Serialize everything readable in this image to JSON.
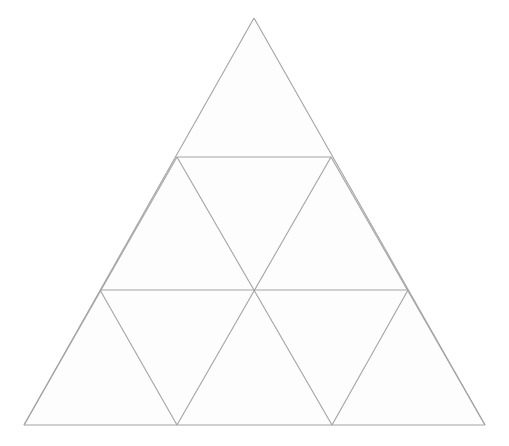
{
  "canvas": {
    "width": 509,
    "height": 446,
    "background_color": "#ffffff"
  },
  "figure": {
    "name": "subdivided-equilateral-triangle",
    "title": "",
    "rows": 3,
    "small_triangle_count": 9,
    "upward_triangle_count": 6,
    "downward_triangle_count": 3,
    "stroke_color": "#a3a3a3",
    "stroke_width": 1.1,
    "fill_color": "#fdfdfd",
    "outer_vertices": {
      "apex": [
        254,
        18
      ],
      "bottom_left": [
        24,
        425
      ],
      "bottom_right": [
        485,
        425
      ]
    },
    "row_baselines_y": [
      18,
      157,
      290,
      425
    ],
    "lattice_points": [
      {
        "id": "A",
        "label": "apex",
        "x": 254,
        "y": 18
      },
      {
        "id": "B1",
        "label": "row1-left",
        "x": 177,
        "y": 157
      },
      {
        "id": "B2",
        "label": "row1-right",
        "x": 331,
        "y": 157
      },
      {
        "id": "C1",
        "label": "row2-left",
        "x": 100,
        "y": 290
      },
      {
        "id": "C2",
        "label": "row2-center",
        "x": 254,
        "y": 290
      },
      {
        "id": "C3",
        "label": "row2-right",
        "x": 408,
        "y": 290
      },
      {
        "id": "D1",
        "label": "base-left",
        "x": 24,
        "y": 425
      },
      {
        "id": "D2",
        "label": "base-mid-left",
        "x": 177,
        "y": 425
      },
      {
        "id": "D3",
        "label": "base-mid-right",
        "x": 332,
        "y": 425
      },
      {
        "id": "D4",
        "label": "base-right",
        "x": 485,
        "y": 425
      }
    ],
    "faces": [
      {
        "id": "t1",
        "orientation": "up",
        "row": 1,
        "points": "254,18 177,157 331,157"
      },
      {
        "id": "t2",
        "orientation": "up",
        "row": 2,
        "points": "177,157 100,290 254,290"
      },
      {
        "id": "t3",
        "orientation": "down",
        "row": 2,
        "points": "331,157 177,157 254,290"
      },
      {
        "id": "t4",
        "orientation": "up",
        "row": 2,
        "points": "331,157 254,290 408,290"
      },
      {
        "id": "t5",
        "orientation": "up",
        "row": 3,
        "points": "100,290 24,425 177,425"
      },
      {
        "id": "t6",
        "orientation": "down",
        "row": 3,
        "points": "254,290 100,290 177,425"
      },
      {
        "id": "t7",
        "orientation": "up",
        "row": 3,
        "points": "254,290 177,425 332,425"
      },
      {
        "id": "t8",
        "orientation": "down",
        "row": 3,
        "points": "408,290 254,290 332,425"
      },
      {
        "id": "t9",
        "orientation": "up",
        "row": 3,
        "points": "408,290 332,425 485,425"
      }
    ],
    "edges": [
      {
        "id": "e-outer-left",
        "label": "outer-left-side",
        "x1": 254,
        "y1": 18,
        "x2": 24,
        "y2": 425
      },
      {
        "id": "e-outer-right",
        "label": "outer-right-side",
        "x1": 254,
        "y1": 18,
        "x2": 485,
        "y2": 425
      },
      {
        "id": "e-outer-base",
        "label": "outer-base",
        "x1": 24,
        "y1": 425,
        "x2": 485,
        "y2": 425
      },
      {
        "id": "e-h1",
        "label": "horizontal-upper",
        "x1": 177,
        "y1": 157,
        "x2": 331,
        "y2": 157
      },
      {
        "id": "e-h2",
        "label": "horizontal-lower",
        "x1": 100,
        "y1": 290,
        "x2": 408,
        "y2": 290
      },
      {
        "id": "e-d-left-1",
        "label": "left-leaning-short",
        "x1": 331,
        "y1": 157,
        "x2": 177,
        "y2": 425
      },
      {
        "id": "e-d-left-2",
        "label": "left-leaning-long",
        "x1": 177,
        "y1": 157,
        "x2": 24,
        "y2": 425
      },
      {
        "id": "e-d-left-3",
        "label": "left-leaning-lowest",
        "x1": 408,
        "y1": 290,
        "x2": 332,
        "y2": 425
      },
      {
        "id": "e-d-right-1",
        "label": "right-leaning-short",
        "x1": 177,
        "y1": 157,
        "x2": 332,
        "y2": 425
      },
      {
        "id": "e-d-right-2",
        "label": "right-leaning-long",
        "x1": 331,
        "y1": 157,
        "x2": 485,
        "y2": 425
      },
      {
        "id": "e-d-right-3",
        "label": "right-leaning-lowest",
        "x1": 100,
        "y1": 290,
        "x2": 177,
        "y2": 425
      }
    ]
  }
}
